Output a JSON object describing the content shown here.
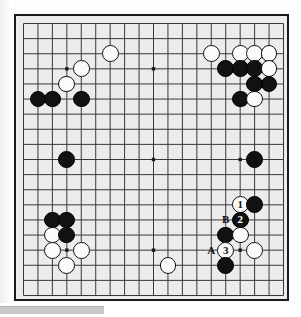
{
  "figure": {
    "kind": "go-board-diagram",
    "board_size": 19,
    "colors": {
      "board": "#ececec",
      "grid_line": "#3a3a3a",
      "black_stone": "#111111",
      "white_stone": "#fbfbfb",
      "border": "#1a1a1a",
      "page_background": "#ffffff",
      "gutter_bar": "#c9c9c9"
    },
    "star_points": [
      {
        "col": 3,
        "row": 3
      },
      {
        "col": 9,
        "row": 3
      },
      {
        "col": 15,
        "row": 3
      },
      {
        "col": 3,
        "row": 9
      },
      {
        "col": 9,
        "row": 9
      },
      {
        "col": 15,
        "row": 9
      },
      {
        "col": 3,
        "row": 15
      },
      {
        "col": 9,
        "row": 15
      },
      {
        "col": 15,
        "row": 15
      }
    ]
  },
  "stones": [
    {
      "col": 6,
      "row": 2,
      "color": "white",
      "label": ""
    },
    {
      "col": 4,
      "row": 3,
      "color": "white",
      "label": ""
    },
    {
      "col": 3,
      "row": 4,
      "color": "white",
      "label": ""
    },
    {
      "col": 1,
      "row": 5,
      "color": "black",
      "label": ""
    },
    {
      "col": 2,
      "row": 5,
      "color": "black",
      "label": ""
    },
    {
      "col": 4,
      "row": 5,
      "color": "black",
      "label": ""
    },
    {
      "col": 13,
      "row": 2,
      "color": "white",
      "label": ""
    },
    {
      "col": 15,
      "row": 2,
      "color": "white",
      "label": ""
    },
    {
      "col": 16,
      "row": 2,
      "color": "white",
      "label": ""
    },
    {
      "col": 17,
      "row": 2,
      "color": "white",
      "label": ""
    },
    {
      "col": 14,
      "row": 3,
      "color": "black",
      "label": ""
    },
    {
      "col": 15,
      "row": 3,
      "color": "black",
      "label": ""
    },
    {
      "col": 16,
      "row": 3,
      "color": "black",
      "label": ""
    },
    {
      "col": 17,
      "row": 3,
      "color": "white",
      "label": ""
    },
    {
      "col": 16,
      "row": 4,
      "color": "black",
      "label": ""
    },
    {
      "col": 17,
      "row": 4,
      "color": "black",
      "label": ""
    },
    {
      "col": 15,
      "row": 5,
      "color": "black",
      "label": ""
    },
    {
      "col": 16,
      "row": 5,
      "color": "white",
      "label": ""
    },
    {
      "col": 3,
      "row": 9,
      "color": "black",
      "label": ""
    },
    {
      "col": 16,
      "row": 9,
      "color": "black",
      "label": ""
    },
    {
      "col": 15,
      "row": 12,
      "color": "white",
      "label": "1"
    },
    {
      "col": 16,
      "row": 12,
      "color": "black",
      "label": ""
    },
    {
      "col": 15,
      "row": 13,
      "color": "black",
      "label": "2"
    },
    {
      "col": 14,
      "row": 14,
      "color": "black",
      "label": ""
    },
    {
      "col": 15,
      "row": 14,
      "color": "white",
      "label": ""
    },
    {
      "col": 14,
      "row": 15,
      "color": "white",
      "label": "3"
    },
    {
      "col": 16,
      "row": 15,
      "color": "white",
      "label": ""
    },
    {
      "col": 14,
      "row": 16,
      "color": "black",
      "label": ""
    },
    {
      "col": 2,
      "row": 13,
      "color": "black",
      "label": ""
    },
    {
      "col": 3,
      "row": 13,
      "color": "black",
      "label": ""
    },
    {
      "col": 2,
      "row": 14,
      "color": "white",
      "label": ""
    },
    {
      "col": 3,
      "row": 14,
      "color": "black",
      "label": ""
    },
    {
      "col": 2,
      "row": 15,
      "color": "white",
      "label": ""
    },
    {
      "col": 4,
      "row": 15,
      "color": "white",
      "label": ""
    },
    {
      "col": 3,
      "row": 16,
      "color": "white",
      "label": ""
    },
    {
      "col": 10,
      "row": 16,
      "color": "white",
      "label": ""
    }
  ],
  "point_labels": [
    {
      "col": 14,
      "row": 13,
      "text": "B"
    },
    {
      "col": 13,
      "row": 15,
      "text": "A"
    }
  ],
  "move_sequence": [
    {
      "number": "1",
      "color": "white",
      "col": 15,
      "row": 12
    },
    {
      "number": "2",
      "color": "black",
      "col": 15,
      "row": 13
    },
    {
      "number": "3",
      "color": "white",
      "col": 14,
      "row": 15
    }
  ]
}
